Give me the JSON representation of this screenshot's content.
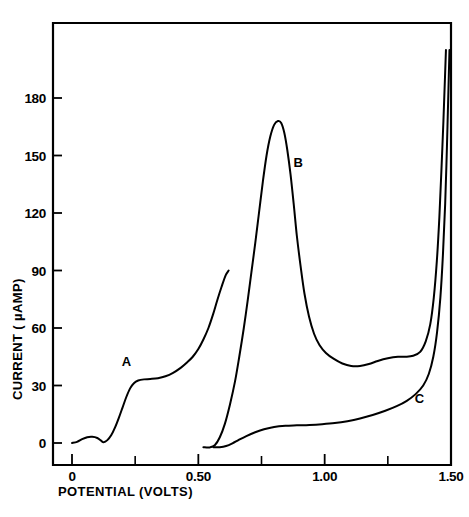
{
  "chart_data": {
    "type": "line",
    "title": "",
    "xlabel": "POTENTIAL (VOLTS)",
    "ylabel": "CURRENT ( µAMP)",
    "xlim": [
      -0.075,
      1.55
    ],
    "ylim": [
      -12,
      205
    ],
    "grid": false,
    "legend_position": "inline-annotations",
    "x_ticks_major": [
      0,
      0.5,
      1.0,
      1.5
    ],
    "x_tick_labels": [
      "0",
      "0.50",
      "1.00",
      "1.50"
    ],
    "x_ticks_minor": [
      0.25,
      0.75,
      1.25
    ],
    "y_ticks_major": [
      0,
      30,
      60,
      90,
      120,
      150,
      180
    ],
    "y_tick_labels": [
      "0",
      "30",
      "60",
      "90",
      "120",
      "150",
      "180"
    ],
    "annotations": [
      {
        "text": "A",
        "x": 0.215,
        "y": 40
      },
      {
        "text": "B",
        "x": 0.895,
        "y": 144
      },
      {
        "text": "C",
        "x": 1.375,
        "y": 21
      }
    ],
    "series": [
      {
        "name": "A",
        "label": "A",
        "color": "#000000",
        "points": [
          [
            0.0,
            0.0
          ],
          [
            0.02,
            0.6
          ],
          [
            0.04,
            2.0
          ],
          [
            0.06,
            3.0
          ],
          [
            0.08,
            3.2
          ],
          [
            0.1,
            2.6
          ],
          [
            0.115,
            1.2
          ],
          [
            0.125,
            0.4
          ],
          [
            0.14,
            1.5
          ],
          [
            0.155,
            4.0
          ],
          [
            0.17,
            8.0
          ],
          [
            0.185,
            13.0
          ],
          [
            0.2,
            18.5
          ],
          [
            0.215,
            24.0
          ],
          [
            0.23,
            28.5
          ],
          [
            0.245,
            31.2
          ],
          [
            0.262,
            32.6
          ],
          [
            0.285,
            33.2
          ],
          [
            0.31,
            33.4
          ],
          [
            0.34,
            33.8
          ],
          [
            0.37,
            34.8
          ],
          [
            0.4,
            36.6
          ],
          [
            0.43,
            39.2
          ],
          [
            0.455,
            42.0
          ],
          [
            0.478,
            45.0
          ],
          [
            0.5,
            49.0
          ],
          [
            0.52,
            54.0
          ],
          [
            0.54,
            60.0
          ],
          [
            0.558,
            67.0
          ],
          [
            0.575,
            74.5
          ],
          [
            0.592,
            81.5
          ],
          [
            0.608,
            87.5
          ],
          [
            0.62,
            90.0
          ]
        ]
      },
      {
        "name": "B",
        "label": "B",
        "color": "#000000",
        "points": [
          [
            0.52,
            -2.2
          ],
          [
            0.545,
            -2.3
          ],
          [
            0.565,
            -1.2
          ],
          [
            0.585,
            3.0
          ],
          [
            0.605,
            10.0
          ],
          [
            0.625,
            20.0
          ],
          [
            0.645,
            32.0
          ],
          [
            0.662,
            45.0
          ],
          [
            0.68,
            60.0
          ],
          [
            0.695,
            74.0
          ],
          [
            0.71,
            89.0
          ],
          [
            0.725,
            104.0
          ],
          [
            0.74,
            120.0
          ],
          [
            0.755,
            136.0
          ],
          [
            0.77,
            150.0
          ],
          [
            0.785,
            160.0
          ],
          [
            0.8,
            166.0
          ],
          [
            0.815,
            168.0
          ],
          [
            0.828,
            167.0
          ],
          [
            0.84,
            162.0
          ],
          [
            0.852,
            153.0
          ],
          [
            0.865,
            140.0
          ],
          [
            0.878,
            124.0
          ],
          [
            0.89,
            108.0
          ],
          [
            0.905,
            92.0
          ],
          [
            0.92,
            78.0
          ],
          [
            0.938,
            66.0
          ],
          [
            0.958,
            57.0
          ],
          [
            0.98,
            51.0
          ],
          [
            1.005,
            47.0
          ],
          [
            1.035,
            44.0
          ],
          [
            1.07,
            41.5
          ],
          [
            1.105,
            40.2
          ],
          [
            1.14,
            40.2
          ],
          [
            1.175,
            41.2
          ],
          [
            1.21,
            42.8
          ],
          [
            1.25,
            44.2
          ],
          [
            1.29,
            45.0
          ],
          [
            1.32,
            45.0
          ],
          [
            1.35,
            45.5
          ],
          [
            1.378,
            47.5
          ],
          [
            1.4,
            53.0
          ],
          [
            1.418,
            62.0
          ],
          [
            1.432,
            76.0
          ],
          [
            1.444,
            95.0
          ],
          [
            1.454,
            118.0
          ],
          [
            1.462,
            142.0
          ],
          [
            1.47,
            168.0
          ],
          [
            1.476,
            190.0
          ],
          [
            1.48,
            205.0
          ]
        ]
      },
      {
        "name": "C",
        "label": "C",
        "color": "#000000",
        "points": [
          [
            0.56,
            -2.2
          ],
          [
            0.585,
            -2.2
          ],
          [
            0.61,
            -1.6
          ],
          [
            0.635,
            -0.2
          ],
          [
            0.66,
            1.6
          ],
          [
            0.69,
            3.6
          ],
          [
            0.725,
            5.6
          ],
          [
            0.76,
            7.2
          ],
          [
            0.8,
            8.4
          ],
          [
            0.845,
            9.0
          ],
          [
            0.89,
            9.2
          ],
          [
            0.94,
            9.4
          ],
          [
            0.99,
            9.8
          ],
          [
            1.04,
            10.4
          ],
          [
            1.09,
            11.4
          ],
          [
            1.14,
            12.8
          ],
          [
            1.19,
            14.6
          ],
          [
            1.24,
            16.8
          ],
          [
            1.285,
            19.2
          ],
          [
            1.325,
            22.0
          ],
          [
            1.36,
            25.5
          ],
          [
            1.39,
            30.0
          ],
          [
            1.412,
            36.0
          ],
          [
            1.43,
            45.0
          ],
          [
            1.445,
            58.0
          ],
          [
            1.458,
            76.0
          ],
          [
            1.468,
            98.0
          ],
          [
            1.477,
            125.0
          ],
          [
            1.484,
            155.0
          ],
          [
            1.49,
            185.0
          ],
          [
            1.494,
            205.0
          ]
        ]
      }
    ]
  }
}
